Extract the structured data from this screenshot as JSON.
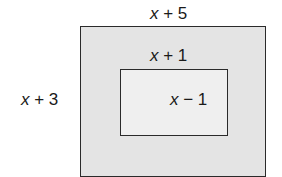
{
  "diagram": {
    "outer_rect": {
      "width_label": "x + 5",
      "height_label": "x + 3",
      "fill": "#e4e4e4"
    },
    "inner_rect": {
      "width_label": "x + 1",
      "height_label": "x − 1",
      "fill": "#efefef"
    },
    "stroke_color": "#2a2a2a"
  }
}
